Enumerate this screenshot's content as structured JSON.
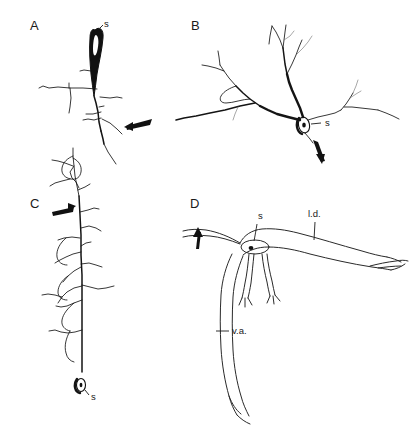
{
  "figure": {
    "background_color": "#ffffff",
    "ink_color": "#141414",
    "width": 420,
    "height": 430,
    "type": "line-drawing-figure"
  },
  "panels": [
    {
      "id": "A",
      "letter": "A",
      "letter_x": 30,
      "letter_y": 30,
      "soma_label": "s",
      "soma_label_x": 104,
      "soma_label_y": 27,
      "soma_style": "filled-elongated",
      "arrow_label": "",
      "arrow_direction": "left-down",
      "orientation": "vertical-descending-axon"
    },
    {
      "id": "B",
      "letter": "B",
      "letter_x": 191,
      "letter_y": 30,
      "soma_label": "s",
      "soma_label_x": 325,
      "soma_label_y": 126,
      "soma_style": "open-oval",
      "arrow_label": "",
      "arrow_direction": "down-left",
      "orientation": "horizontal-branching"
    },
    {
      "id": "C",
      "letter": "C",
      "letter_x": 30,
      "letter_y": 208,
      "soma_label": "s",
      "soma_label_x": 91,
      "soma_label_y": 400,
      "soma_style": "open-oval-small",
      "arrow_label": "",
      "arrow_direction": "right",
      "orientation": "vertical-long-shaft"
    },
    {
      "id": "D",
      "letter": "D",
      "letter_x": 190,
      "letter_y": 208,
      "soma_label": "s",
      "soma_label_x": 258,
      "soma_label_y": 219,
      "soma_style": "outline-oval-with-nucleus",
      "arrow_label": "",
      "arrow_direction": "up",
      "orientation": "schematic-outline"
    }
  ],
  "annotations": [
    {
      "id": "lateral-dendrite",
      "text": "l.d.",
      "x": 308,
      "y": 217,
      "leader": true
    },
    {
      "id": "ventral-axon",
      "text": "v.a.",
      "x": 232,
      "y": 334,
      "leader": true
    }
  ]
}
